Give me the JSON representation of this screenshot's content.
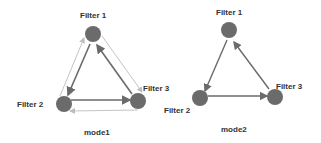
{
  "diagrams": [
    {
      "caption": "mode1",
      "nodes": [
        {
          "id": "F1",
          "label": "Filter  1"
        },
        {
          "id": "F2",
          "label": "Filter  2"
        },
        {
          "id": "F3",
          "label": "Filter  3"
        }
      ],
      "edges": [
        {
          "from": "F1",
          "to": "F2",
          "style": "thick"
        },
        {
          "from": "F2",
          "to": "F3",
          "style": "thick"
        },
        {
          "from": "F3",
          "to": "F1",
          "style": "thick"
        },
        {
          "from": "F2",
          "to": "F1",
          "style": "thin"
        },
        {
          "from": "F1",
          "to": "F3",
          "style": "thin"
        },
        {
          "from": "F3",
          "to": "F2",
          "style": "thin"
        }
      ]
    },
    {
      "caption": "mode2",
      "nodes": [
        {
          "id": "F1",
          "label": "Filter  1"
        },
        {
          "id": "F2",
          "label": "Filter  2"
        },
        {
          "id": "F3",
          "label": "Filter  3"
        }
      ],
      "edges": [
        {
          "from": "F1",
          "to": "F2",
          "style": "thick"
        },
        {
          "from": "F2",
          "to": "F3",
          "style": "thick"
        },
        {
          "from": "F3",
          "to": "F1",
          "style": "thick"
        }
      ]
    }
  ],
  "colors": {
    "node": "#6b6b6b",
    "thick_edge": "#6a6a6a",
    "thin_edge": "#c4c4c4"
  }
}
